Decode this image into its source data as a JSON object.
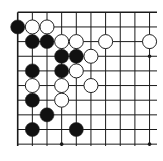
{
  "diagram": {
    "type": "go-board-corner",
    "grid": {
      "origin_x": 17.7,
      "origin_y": 12.3,
      "spacing": 14.65,
      "cols_visible": 10,
      "rows_visible": 10,
      "extend_right_to": 157,
      "extend_down_to": 146,
      "line_color": "#1a1a1a",
      "top_edge": true,
      "left_edge": true
    },
    "star_points": [
      {
        "col": 9,
        "row": 3
      },
      {
        "col": 3,
        "row": 9
      },
      {
        "col": 9,
        "row": 9
      }
    ],
    "stones": [
      {
        "color": "black",
        "col": 0,
        "row": 1
      },
      {
        "color": "white",
        "col": 1,
        "row": 1
      },
      {
        "color": "white",
        "col": 2,
        "row": 1
      },
      {
        "color": "black",
        "col": 1,
        "row": 2
      },
      {
        "color": "black",
        "col": 2,
        "row": 2
      },
      {
        "color": "white",
        "col": 3,
        "row": 2
      },
      {
        "color": "white",
        "col": 4,
        "row": 2
      },
      {
        "color": "white",
        "col": 6,
        "row": 2
      },
      {
        "color": "white",
        "col": 9,
        "row": 2
      },
      {
        "color": "black",
        "col": 3,
        "row": 3
      },
      {
        "color": "black",
        "col": 4,
        "row": 3
      },
      {
        "color": "white",
        "col": 5,
        "row": 3
      },
      {
        "color": "black",
        "col": 1,
        "row": 4
      },
      {
        "color": "black",
        "col": 3,
        "row": 4
      },
      {
        "color": "white",
        "col": 4,
        "row": 4
      },
      {
        "color": "white",
        "col": 1,
        "row": 5
      },
      {
        "color": "white",
        "col": 3,
        "row": 5
      },
      {
        "color": "white",
        "col": 5,
        "row": 5
      },
      {
        "color": "black",
        "col": 1,
        "row": 6
      },
      {
        "color": "white",
        "col": 3,
        "row": 6
      },
      {
        "color": "black",
        "col": 2,
        "row": 7
      },
      {
        "color": "black",
        "col": 1,
        "row": 8
      },
      {
        "color": "black",
        "col": 4,
        "row": 8
      }
    ],
    "colors": {
      "black_stone": "#111111",
      "white_stone": "#ffffff",
      "stone_outline": "#222222",
      "background": "#ffffff"
    }
  }
}
